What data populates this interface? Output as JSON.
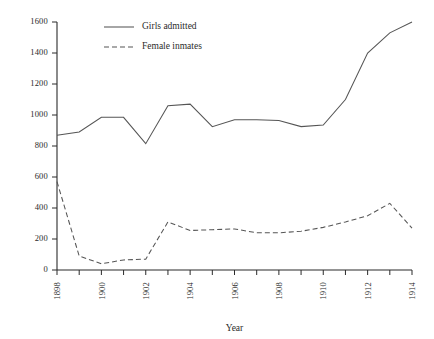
{
  "chart_data": {
    "type": "line",
    "title": "",
    "xlabel": "Year",
    "ylabel": "",
    "x": [
      1898,
      1899,
      1900,
      1901,
      1902,
      1903,
      1904,
      1905,
      1906,
      1907,
      1908,
      1909,
      1910,
      1911,
      1912,
      1913,
      1914
    ],
    "xlim": [
      1898,
      1914
    ],
    "ylim": [
      0,
      1600
    ],
    "xticks": [
      1898,
      1899,
      1900,
      1901,
      1902,
      1903,
      1904,
      1905,
      1906,
      1907,
      1908,
      1909,
      1910,
      1911,
      1912,
      1913,
      1914
    ],
    "xtick_labels": [
      "1898",
      "",
      "1900",
      "",
      "1902",
      "",
      "1904",
      "",
      "1906",
      "",
      "1908",
      "",
      "1910",
      "",
      "1912",
      "",
      "1914"
    ],
    "yticks": [
      0,
      200,
      400,
      600,
      800,
      1000,
      1200,
      1400,
      1600
    ],
    "ytick_labels": [
      "0",
      "200",
      "400",
      "600",
      "800",
      "1000",
      "1200",
      "1400",
      "1600"
    ],
    "grid": false,
    "legend_position": "top-center",
    "series": [
      {
        "name": "Girls admitted",
        "style": "solid",
        "color": "#555555",
        "values": [
          870,
          890,
          985,
          985,
          815,
          1060,
          1070,
          925,
          970,
          970,
          965,
          925,
          935,
          1100,
          1400,
          1530,
          1600
        ]
      },
      {
        "name": "Female inmates",
        "style": "dashed",
        "color": "#555555",
        "values": [
          570,
          90,
          40,
          65,
          70,
          310,
          255,
          260,
          265,
          240,
          240,
          250,
          275,
          310,
          350,
          430,
          270
        ]
      }
    ]
  },
  "legend": {
    "items": [
      {
        "label": "Girls admitted",
        "style": "solid"
      },
      {
        "label": "Female inmates",
        "style": "dashed"
      }
    ]
  },
  "axes": {
    "x_title": "Year"
  },
  "colors": {
    "line": "#555555",
    "axis": "#2b2b2b",
    "background": "#ffffff"
  }
}
